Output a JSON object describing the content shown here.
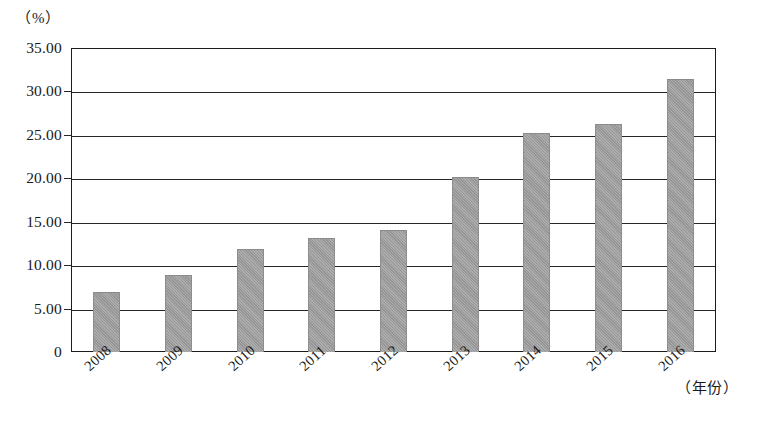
{
  "chart_data": {
    "type": "bar",
    "title": "",
    "subtitle": "",
    "xlabel": "（年份）",
    "ylabel": "（%）",
    "categories": [
      "2008",
      "2009",
      "2010",
      "2011",
      "2012",
      "2013",
      "2014",
      "2015",
      "2016"
    ],
    "values": [
      6.9,
      8.9,
      11.9,
      13.1,
      14.1,
      20.2,
      25.2,
      26.3,
      31.4
    ],
    "series": [
      {
        "name": "",
        "values": [
          6.9,
          8.9,
          11.9,
          13.1,
          14.1,
          20.2,
          25.2,
          26.3,
          31.4
        ]
      }
    ],
    "ylim": [
      0,
      35
    ],
    "ytick_values": [
      35,
      30,
      25,
      20,
      15,
      10,
      5,
      0
    ],
    "ytick_labels": [
      "35.00",
      "30.00",
      "25.00",
      "20.00",
      "15.00",
      "10.00",
      "5.00",
      "0"
    ],
    "ytick_step": 5,
    "grid": true,
    "grid_axis": "y",
    "legend": false,
    "legend_position": "none",
    "bar_color": "#9d9d9d",
    "axis_color": "#262626",
    "background_color": "#ffffff",
    "xlabel_rotation": -42,
    "annotations": []
  },
  "axis": {
    "unit_label": "（%）",
    "year_label": "（年份）"
  }
}
